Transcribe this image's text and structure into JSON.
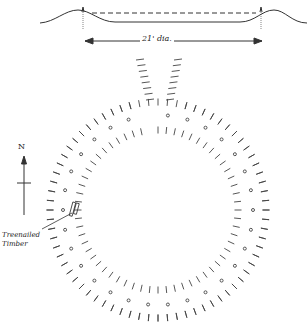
{
  "diagram": {
    "type": "archaeological site plan with profile section",
    "profile": {
      "dimension_label": "21' dia."
    },
    "plan": {
      "north_label": "N",
      "annotation": "Treenailed Timber",
      "features": [
        "outer ring of stake marks",
        "ring of post holes",
        "inner ring of stake marks",
        "entrance gap to north"
      ]
    },
    "colors": {
      "ink": "#333333",
      "paper": "#ffffff"
    }
  }
}
